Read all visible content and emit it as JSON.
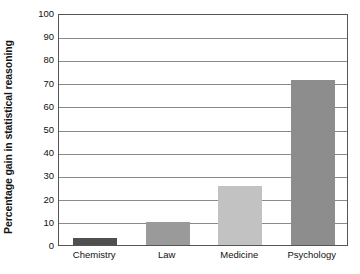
{
  "chart_data": {
    "type": "bar",
    "title": "",
    "xlabel": "",
    "ylabel": "Percentage gain in statistical reasoning",
    "categories": [
      "Chemistry",
      "Law",
      "Medicine",
      "Psychology"
    ],
    "values": [
      3,
      10,
      25.5,
      71
    ],
    "ylim": [
      0,
      100
    ],
    "ytick_labels": [
      "0",
      "10",
      "20",
      "30",
      "40",
      "50",
      "60",
      "70",
      "80",
      "90",
      "100"
    ],
    "ytick_values": [
      0,
      10,
      20,
      30,
      40,
      50,
      60,
      70,
      80,
      90,
      100
    ],
    "grid": true,
    "legend": "none",
    "bar_colors": [
      "#4f4f4f",
      "#9a9a9a",
      "#c2c2c2",
      "#8d8d8d"
    ],
    "frame_color": "#555555",
    "gridline_color": "#8a8a8a",
    "background": "#ffffff"
  }
}
